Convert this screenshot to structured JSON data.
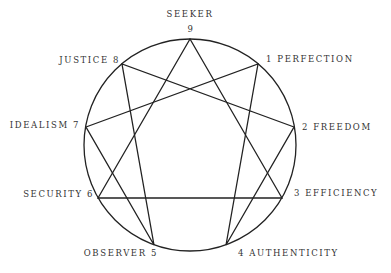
{
  "diagram": {
    "circle": {
      "cx": 190,
      "cy": 145,
      "r": 106,
      "stroke": "#222222"
    },
    "points": [
      {
        "num": "9",
        "name": "SEEKER",
        "x": 190,
        "y": 39
      },
      {
        "num": "1",
        "name": "PERFECTION",
        "x": 258,
        "y": 64
      },
      {
        "num": "2",
        "name": "FREEDOM",
        "x": 294,
        "y": 127
      },
      {
        "num": "3",
        "name": "EFFICIENCY",
        "x": 282,
        "y": 198
      },
      {
        "num": "4",
        "name": "AUTHENTICITY",
        "x": 226,
        "y": 245
      },
      {
        "num": "5",
        "name": "OBSERVER",
        "x": 154,
        "y": 245
      },
      {
        "num": "6",
        "name": "SECURITY",
        "x": 98,
        "y": 198
      },
      {
        "num": "7",
        "name": "IDEALISM",
        "x": 86,
        "y": 127
      },
      {
        "num": "8",
        "name": "JUSTICE",
        "x": 122,
        "y": 64
      }
    ],
    "labels": {
      "p9_name": "SEEKER",
      "p9_num": "9",
      "p1": "1 PERFECTION",
      "p2": "2 FREEDOM",
      "p3": "3 EFFICIENCY",
      "p4": "4 AUTHENTICITY",
      "p5": "OBSERVER 5",
      "p6": "SECURITY 6",
      "p7": "IDEALISM 7",
      "p8": "JUSTICE 8"
    },
    "triangle": [
      "9",
      "3",
      "6"
    ],
    "hexad": [
      "1",
      "4",
      "2",
      "8",
      "5",
      "7"
    ]
  }
}
